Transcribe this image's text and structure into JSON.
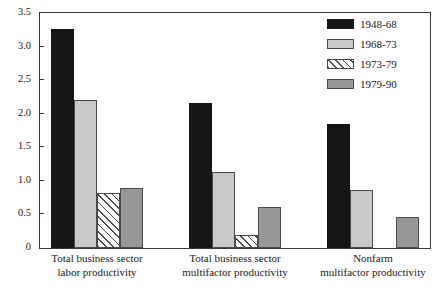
{
  "chart_data": {
    "type": "bar",
    "title": "",
    "subtitle": "",
    "xlabel": "",
    "ylabel": "",
    "ylim": [
      0,
      3.5
    ],
    "grid": false,
    "legend_position": "top-right-inside",
    "orientation": "vertical-grouped",
    "categories": [
      "Total business sector labor productivity",
      "Total business sector multifactor productivity",
      "Nonfarm multifactor productivity"
    ],
    "category_lines": [
      [
        "Total business sector",
        "labor productivity"
      ],
      [
        "Total business sector",
        "multifactor productivity"
      ],
      [
        "Nonfarm",
        "multifactor productivity"
      ]
    ],
    "ytick_labels": [
      "0",
      "0.5",
      "1.0",
      "1.5",
      "2.0",
      "2.5",
      "3.0",
      "3.5"
    ],
    "ytick_values": [
      0,
      0.5,
      1.0,
      1.5,
      2.0,
      2.5,
      3.0,
      3.5
    ],
    "series": [
      {
        "name": "1948-68",
        "fill": "solid-black",
        "color": "#151515",
        "values": [
          3.26,
          2.16,
          1.84
        ]
      },
      {
        "name": "1968-73",
        "fill": "solid-light-gray",
        "color": "#c9c9c9",
        "values": [
          2.21,
          1.13,
          0.86
        ]
      },
      {
        "name": "1973-79",
        "fill": "diagonal-hatch-white",
        "color": "#ffffff",
        "values": [
          0.82,
          0.2,
          0
        ]
      },
      {
        "name": "1979-90",
        "fill": "solid-medium-gray",
        "color": "#979797",
        "values": [
          0.89,
          0.61,
          0.46
        ]
      }
    ]
  }
}
